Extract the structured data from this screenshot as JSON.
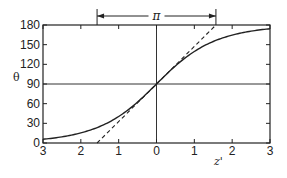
{
  "chart_data": {
    "type": "line",
    "title": "",
    "xlabel": "z'",
    "ylabel": "θ",
    "xlim": [
      -3,
      3
    ],
    "ylim": [
      0,
      180
    ],
    "x_ticks": [
      -3,
      -2,
      -1,
      0,
      1,
      2,
      3
    ],
    "x_tick_labels": [
      "3",
      "2",
      "1",
      "0",
      "1",
      "2",
      "3"
    ],
    "y_ticks": [
      0,
      30,
      60,
      90,
      120,
      150,
      180
    ],
    "y_tick_labels": [
      "0",
      "30",
      "60",
      "90",
      "120",
      "150",
      "180"
    ],
    "grid": false,
    "reference_lines": [
      {
        "name": "horizontal-90",
        "orientation": "horizontal",
        "value": 90
      },
      {
        "name": "vertical-0",
        "orientation": "vertical",
        "value": 0
      }
    ],
    "series": [
      {
        "name": "theta-curve",
        "style": "solid",
        "function": "theta = 2*atan(exp(z')) in degrees",
        "x": [
          -3,
          -2.5,
          -2,
          -1.5,
          -1,
          -0.5,
          0,
          0.5,
          1,
          1.5,
          2,
          2.5,
          3
        ],
        "y": [
          5.7,
          9.4,
          15.4,
          25.2,
          40.4,
          62.5,
          90,
          117.5,
          139.6,
          154.8,
          164.6,
          170.6,
          174.3
        ]
      },
      {
        "name": "tangent-line",
        "style": "dashed",
        "x": [
          -1.5708,
          1.5708
        ],
        "y": [
          0,
          180
        ]
      }
    ],
    "annotations": [
      {
        "name": "pi-span",
        "text": "π",
        "from_x": -1.5708,
        "to_x": 1.5708,
        "position": "above-plot"
      }
    ]
  }
}
